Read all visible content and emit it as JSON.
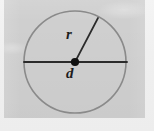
{
  "figure": {
    "type": "geometry-diagram",
    "labels": {
      "radius": "r",
      "center_diameter": "d"
    },
    "colors": {
      "panel_background": "#cfcfcf",
      "page_background": "#f2f2f2",
      "circle_stroke": "#8a8a8a",
      "line_stroke": "#2b2b2b",
      "center_dot": "#111111",
      "label_text": "#1d1d1d"
    },
    "geometry": {
      "center_x": 75,
      "center_y": 62,
      "radius_px": 51,
      "diameter_line_y": 62,
      "diameter_line_x1": 24,
      "diameter_line_x2": 127,
      "radius_line_end_x": 98,
      "radius_line_end_y": 18,
      "center_dot_radius": 4
    }
  }
}
